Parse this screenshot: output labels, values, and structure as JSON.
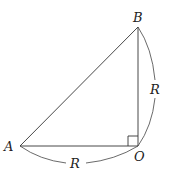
{
  "diagram": {
    "type": "right-triangle-with-arcs",
    "points": {
      "A": {
        "label": "A",
        "x": 20,
        "y": 146
      },
      "O": {
        "label": "O",
        "x": 138,
        "y": 146
      },
      "B": {
        "label": "B",
        "x": 138,
        "y": 27
      }
    },
    "segments": [
      {
        "from": "A",
        "to": "B"
      },
      {
        "from": "A",
        "to": "O"
      },
      {
        "from": "O",
        "to": "B"
      }
    ],
    "right_angle_at": "O",
    "arcs": [
      {
        "from": "A",
        "to": "O",
        "label": "R"
      },
      {
        "from": "O",
        "to": "B",
        "label": "R"
      }
    ],
    "colors": {
      "stroke": "#333333",
      "background": "#ffffff"
    }
  }
}
